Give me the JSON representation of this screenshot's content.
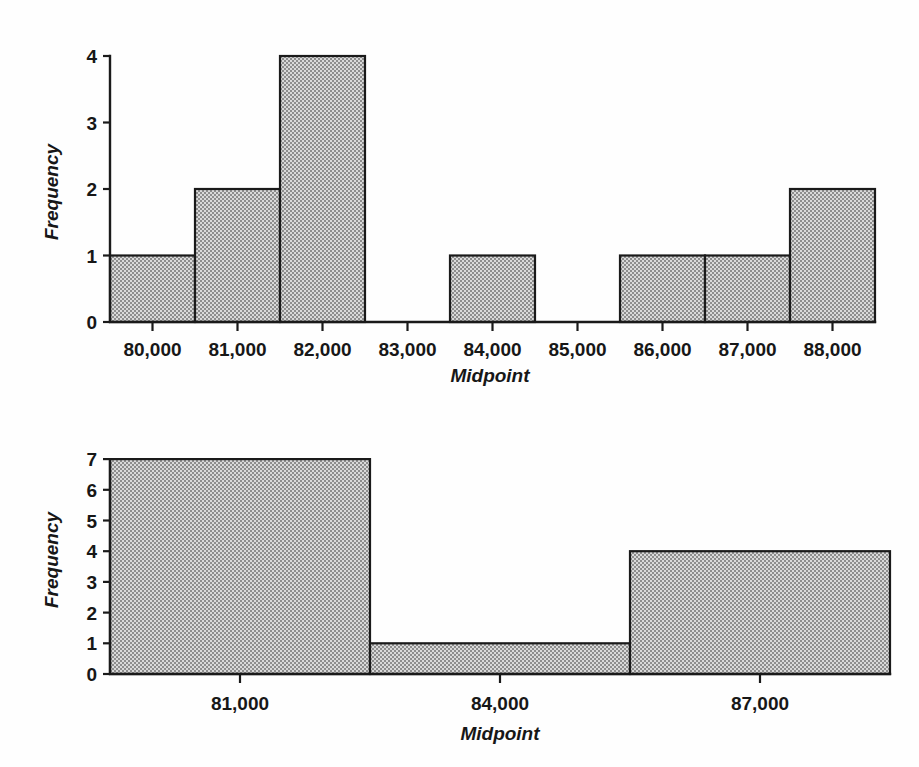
{
  "figures": [
    {
      "id": "histogram-top",
      "xlabel": "Midpoint",
      "ylabel": "Frequency",
      "y_ticks": [
        "0",
        "1",
        "2",
        "3",
        "4"
      ],
      "x_ticks": [
        "80,000",
        "81,000",
        "82,000",
        "83,000",
        "84,000",
        "85,000",
        "86,000",
        "87,000",
        "88,000"
      ]
    },
    {
      "id": "histogram-bottom",
      "xlabel": "Midpoint",
      "ylabel": "Frequency",
      "y_ticks": [
        "0",
        "1",
        "2",
        "3",
        "4",
        "5",
        "6",
        "7"
      ],
      "x_ticks": [
        "81,000",
        "84,000",
        "87,000"
      ]
    }
  ],
  "chart_data": [
    {
      "type": "bar",
      "title": "",
      "xlabel": "Midpoint",
      "ylabel": "Frequency",
      "categories": [
        "80,000",
        "81,000",
        "82,000",
        "83,000",
        "84,000",
        "85,000",
        "86,000",
        "87,000",
        "88,000"
      ],
      "values": [
        1,
        2,
        4,
        0,
        1,
        0,
        1,
        1,
        2
      ],
      "ylim": [
        0,
        4
      ],
      "yticks": [
        0,
        1,
        2,
        3,
        4
      ],
      "grid": false,
      "legend": "none",
      "bar_gap": 0,
      "fill": "#b8b8b8",
      "edge": "#1a1a1a"
    },
    {
      "type": "bar",
      "title": "",
      "xlabel": "Midpoint",
      "ylabel": "Frequency",
      "categories": [
        "81,000",
        "84,000",
        "87,000"
      ],
      "values": [
        7,
        1,
        4
      ],
      "ylim": [
        0,
        7
      ],
      "yticks": [
        0,
        1,
        2,
        3,
        4,
        5,
        6,
        7
      ],
      "grid": false,
      "legend": "none",
      "bar_gap": 0,
      "fill": "#b8b8b8",
      "edge": "#1a1a1a"
    }
  ],
  "colors": {
    "bar_fill": "#b8b8b8",
    "bar_edge": "#1a1a1a",
    "axis": "#1a1a1a",
    "text": "#171717",
    "background": "#fefefe"
  }
}
